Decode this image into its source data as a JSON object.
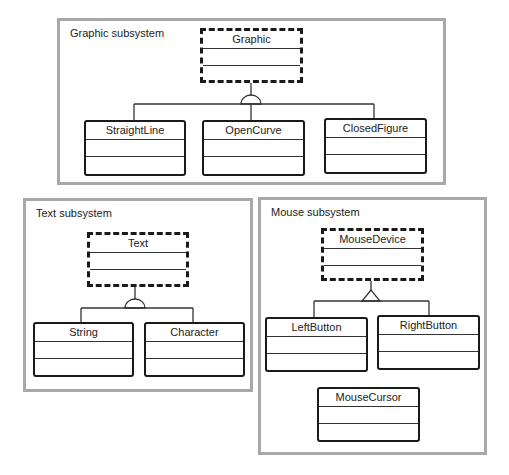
{
  "subsystems": [
    {
      "id": "graphic",
      "title": "Graphic subsystem",
      "classes": [
        {
          "name": "Graphic",
          "abstract": true
        },
        {
          "name": "StraightLine",
          "abstract": false
        },
        {
          "name": "OpenCurve",
          "abstract": false
        },
        {
          "name": "ClosedFigure",
          "abstract": false
        }
      ],
      "relationship": {
        "type": "generalization-semicircle",
        "parent": "Graphic",
        "children": [
          "StraightLine",
          "OpenCurve",
          "ClosedFigure"
        ]
      }
    },
    {
      "id": "text",
      "title": "Text subsystem",
      "classes": [
        {
          "name": "Text",
          "abstract": true
        },
        {
          "name": "String",
          "abstract": false
        },
        {
          "name": "Character",
          "abstract": false
        }
      ],
      "relationship": {
        "type": "generalization-semicircle",
        "parent": "Text",
        "children": [
          "String",
          "Character"
        ]
      }
    },
    {
      "id": "mouse",
      "title": "Mouse subsystem",
      "classes": [
        {
          "name": "MouseDevice",
          "abstract": true
        },
        {
          "name": "LeftButton",
          "abstract": false
        },
        {
          "name": "RightButton",
          "abstract": false
        },
        {
          "name": "MouseCursor",
          "abstract": false
        }
      ],
      "relationship": {
        "type": "generalization-triangle",
        "parent": "MouseDevice",
        "children": [
          "LeftButton",
          "RightButton"
        ]
      }
    }
  ]
}
